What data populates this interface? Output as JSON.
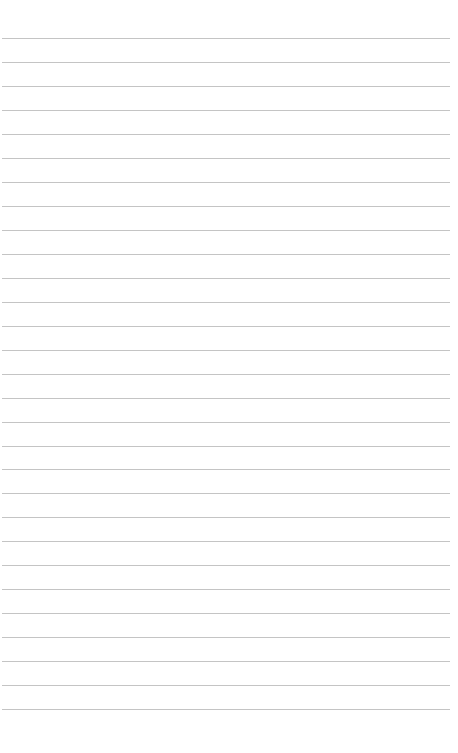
{
  "page": {
    "type": "ruled-paper",
    "background_color": "#ffffff",
    "line_color": "#c4c4c4",
    "line_count": 29,
    "line_spacing_px": 24,
    "first_line_y": 38,
    "line_left_x": 2,
    "line_right_x": 450,
    "lines_y": [
      38,
      62,
      86,
      110,
      134,
      158,
      182,
      206,
      230,
      254,
      278,
      302,
      326,
      350,
      374,
      398,
      422,
      446,
      469,
      493,
      517,
      541,
      565,
      589,
      613,
      637,
      661,
      685,
      709
    ],
    "text_content": []
  }
}
